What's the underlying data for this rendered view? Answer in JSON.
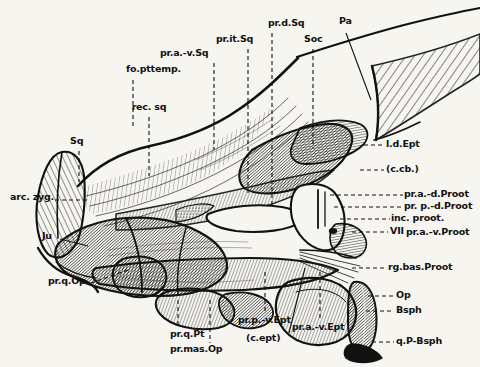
{
  "figure": {
    "background_color": "#f7f5f0",
    "ink_color": "#111111"
  },
  "labels": {
    "top": [
      {
        "id": "fo-pttemp",
        "text": "fo.pttemp.",
        "x": 126,
        "y": 72,
        "align": "left",
        "leader": {
          "type": "dashed-vertical",
          "x": 133,
          "y1": 80,
          "y2": 128
        }
      },
      {
        "id": "pr-a-v-sq",
        "text": "pr.a.-v.Sq",
        "x": 160,
        "y": 56,
        "align": "left",
        "leader": {
          "type": "dashed-vertical",
          "x": 214,
          "y1": 63,
          "y2": 150
        }
      },
      {
        "id": "pr-it-sq",
        "text": "pr.it.Sq",
        "x": 216,
        "y": 42,
        "align": "left",
        "leader": {
          "type": "dashed-vertical",
          "x": 248,
          "y1": 49,
          "y2": 196
        }
      },
      {
        "id": "pr-d-sq",
        "text": "pr.d.Sq",
        "x": 270,
        "y": 26,
        "align": "left",
        "leader": {
          "type": "dashed-vertical",
          "x": 272,
          "y1": 33,
          "y2": 205
        }
      },
      {
        "id": "soc",
        "text": "Soc",
        "x": 305,
        "y": 42,
        "align": "left",
        "leader": {
          "type": "dashed-vertical",
          "x": 313,
          "y1": 49,
          "y2": 148
        }
      },
      {
        "id": "pa",
        "text": "Pa",
        "x": 340,
        "y": 24,
        "align": "left",
        "leader": {
          "type": "solid-diagonal",
          "x1": 346,
          "y1": 33,
          "x2": 371,
          "y2": 100
        }
      }
    ],
    "left": [
      {
        "id": "rec-sq",
        "text": "rec. sq",
        "x": 131,
        "y": 110,
        "align": "center",
        "leader": {
          "type": "dashed-vertical",
          "x": 149,
          "y1": 117,
          "y2": 176
        }
      },
      {
        "id": "sq",
        "text": "Sq",
        "x": 72,
        "y": 144,
        "align": "left",
        "leader": {
          "type": "dashed-vertical",
          "x": 79,
          "y1": 151,
          "y2": 180
        }
      },
      {
        "id": "arc-zyg",
        "text": "arc. zyg.",
        "x": 10,
        "y": 196,
        "align": "left",
        "leader": {
          "type": "dashed-horizontal",
          "x1": 55,
          "y1": 200,
          "x2": 87,
          "y2": 200
        }
      },
      {
        "id": "ju",
        "text": "Ju",
        "x": 44,
        "y": 234,
        "align": "left",
        "leader": {
          "type": "solid-diagonal",
          "x1": 60,
          "y1": 239,
          "x2": 86,
          "y2": 245
        }
      },
      {
        "id": "pr-q-op",
        "text": "pr.q.Op",
        "x": 48,
        "y": 281,
        "align": "left",
        "leader": {
          "type": "dashed-diagonal",
          "x1": 91,
          "y1": 283,
          "x2": 127,
          "y2": 271
        }
      }
    ],
    "right": [
      {
        "id": "l-d-ept",
        "text": "l.d.Ept",
        "x": 386,
        "y": 140,
        "align": "left",
        "leader": {
          "type": "dashed-horizontal",
          "x1": 366,
          "y1": 145,
          "x2": 384,
          "y2": 145
        }
      },
      {
        "id": "c-cb",
        "text": "(c.cb.)",
        "x": 386,
        "y": 165,
        "align": "left",
        "leader": {
          "type": "dashed-horizontal",
          "x1": 362,
          "y1": 170,
          "x2": 384,
          "y2": 170
        }
      },
      {
        "id": "pr-a-d-proot",
        "text": "pr.a.-d.Proot",
        "x": 405,
        "y": 190,
        "align": "left",
        "leader": {
          "type": "dashed-horizontal",
          "x1": 330,
          "y1": 195,
          "x2": 403,
          "y2": 195
        }
      },
      {
        "id": "pr-p-d-proot",
        "text": "pr. p.-d.Proot",
        "x": 405,
        "y": 202,
        "align": "left",
        "leader": {
          "type": "dashed-horizontal",
          "x1": 334,
          "y1": 207,
          "x2": 403,
          "y2": 207
        }
      },
      {
        "id": "inc-proot",
        "text": "inc. proot.",
        "x": 392,
        "y": 214,
        "align": "left",
        "leader": {
          "type": "dashed-horizontal",
          "x1": 340,
          "y1": 219,
          "x2": 390,
          "y2": 219
        }
      },
      {
        "id": "vii",
        "text": "VII",
        "x": 390,
        "y": 228,
        "align": "left",
        "leader": {
          "type": "dashed-horizontal",
          "x1": 352,
          "y1": 232,
          "x2": 388,
          "y2": 232
        }
      },
      {
        "id": "pr-a-v-proot",
        "text": "pr.a.-v.Proot",
        "x": 406,
        "y": 230,
        "align": "left",
        "leader": {
          "type": "none"
        }
      },
      {
        "id": "rg-bas-proot",
        "text": "rg.bas.Proot",
        "x": 388,
        "y": 263,
        "align": "left",
        "leader": {
          "type": "dashed-horizontal",
          "x1": 352,
          "y1": 268,
          "x2": 386,
          "y2": 268
        }
      },
      {
        "id": "op",
        "text": "Op",
        "x": 396,
        "y": 291,
        "align": "left",
        "leader": {
          "type": "dashed-horizontal",
          "x1": 372,
          "y1": 296,
          "x2": 394,
          "y2": 296
        }
      },
      {
        "id": "bsph",
        "text": "Bsph",
        "x": 396,
        "y": 306,
        "align": "left",
        "leader": {
          "type": "dashed-horizontal",
          "x1": 370,
          "y1": 311,
          "x2": 394,
          "y2": 311
        }
      },
      {
        "id": "q-p-bsph",
        "text": "q.P-Bsph",
        "x": 396,
        "y": 338,
        "align": "left",
        "leader": {
          "type": "dashed-horizontal",
          "x1": 372,
          "y1": 342,
          "x2": 394,
          "y2": 342
        }
      }
    ],
    "bottom": [
      {
        "id": "pr-q-pt",
        "text": "pr.q.Pt",
        "x": 172,
        "y": 333,
        "align": "left",
        "leader": {
          "type": "dashed-vertical",
          "x": 178,
          "y1": 300,
          "x2": 0,
          "y2": 328
        }
      },
      {
        "id": "pr-mas-op",
        "text": "pr.mas.Op",
        "x": 172,
        "y": 348,
        "align": "left",
        "leader": {
          "type": "dashed-vertical",
          "x": 210,
          "y1": 300,
          "x2": 0,
          "y2": 343
        }
      },
      {
        "id": "pr-p-v-ept",
        "text": "pr.p.-v.Ept",
        "x": 240,
        "y": 320,
        "align": "left",
        "leader": {
          "type": "dashed-vertical",
          "x": 265,
          "y1": 272,
          "x2": 0,
          "y2": 314
        }
      },
      {
        "id": "c-ept",
        "text": "(c.ept)",
        "x": 248,
        "y": 338,
        "align": "left",
        "leader": {
          "type": "solid-diagonal",
          "x1": 289,
          "y1": 333,
          "x2": 303,
          "y2": 268
        }
      },
      {
        "id": "pr-a-v-ept",
        "text": "pr.a.-v.Ept",
        "x": 293,
        "y": 327,
        "align": "left",
        "leader": {
          "type": "dashed-vertical",
          "x": 320,
          "y1": 272,
          "x2": 0,
          "y2": 320
        }
      }
    ]
  },
  "legend_note": {
    "abbreviations_shown": [
      "fo.pttemp.",
      "pr.a.-v.Sq",
      "pr.it.Sq",
      "pr.d.Sq",
      "Soc",
      "Pa",
      "rec. sq",
      "Sq",
      "arc. zyg.",
      "Ju",
      "pr.q.Op",
      "l.d.Ept",
      "(c.cb.)",
      "pr.a.-d.Proot",
      "pr. p.-d.Proot",
      "inc. proot.",
      "VII",
      "pr.a.-v.Proot",
      "rg.bas.Proot",
      "Op",
      "Bsph",
      "q.P-Bsph",
      "pr.q.Pt",
      "pr.mas.Op",
      "pr.p.-v.Ept",
      "(c.ept)",
      "pr.a.-v.Ept"
    ]
  }
}
